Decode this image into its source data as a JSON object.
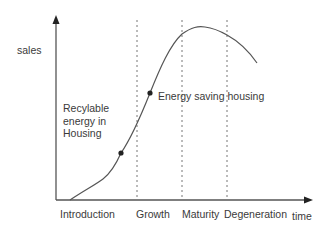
{
  "diagram": {
    "axes": {
      "y_label": "sales",
      "x_label": "time"
    },
    "stages": [
      {
        "label": "Introduction"
      },
      {
        "label": "Growth"
      },
      {
        "label": "Maturity"
      },
      {
        "label": "Degeneration"
      }
    ],
    "annotations": [
      {
        "label": "Recylable energy in Housing"
      },
      {
        "label": "Energy saving housing"
      }
    ],
    "colors": {
      "axis": "#555555",
      "curve": "#555555",
      "dashed": "#777777",
      "text": "#3a3a3a"
    }
  }
}
